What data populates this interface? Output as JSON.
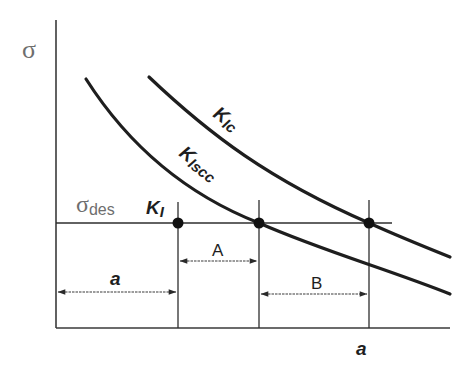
{
  "diagram": {
    "y_axis_label": "σ",
    "x_axis_label": "a",
    "design_stress": {
      "symbol": "σ",
      "subscript": "des"
    },
    "curves": [
      {
        "id": "kic",
        "label_main": "K",
        "label_sub": "Ic"
      },
      {
        "id": "kiscc",
        "label_main": "K",
        "label_sub": "Iscc"
      }
    ],
    "points": [
      {
        "id": "ki",
        "label_main": "K",
        "label_sub": "I"
      },
      {
        "id": "kiscc-intersection"
      },
      {
        "id": "kic-intersection"
      }
    ],
    "dimensions": [
      {
        "id": "crack-length",
        "label": "a"
      },
      {
        "id": "interval-A",
        "label": "A"
      },
      {
        "id": "interval-B",
        "label": "B"
      }
    ],
    "colors": {
      "line": "#1e1e1e",
      "gray_label": "#6e6e6e",
      "background": "#ffffff"
    }
  }
}
